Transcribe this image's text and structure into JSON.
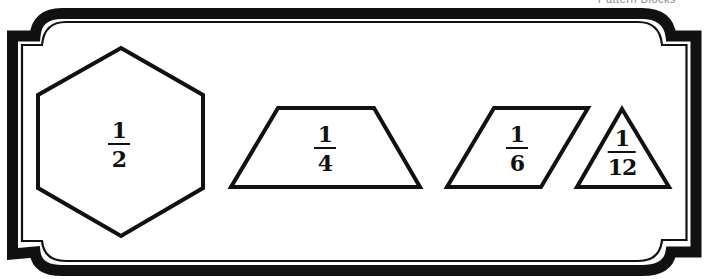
{
  "header": {
    "cropped_caption": "Pattern Blocks"
  },
  "colors": {
    "ink": "#111111",
    "background": "#ffffff"
  },
  "shapes": [
    {
      "name": "hexagon",
      "numerator": "1",
      "denominator": "2"
    },
    {
      "name": "trapezoid",
      "numerator": "1",
      "denominator": "4"
    },
    {
      "name": "rhombus",
      "numerator": "1",
      "denominator": "6"
    },
    {
      "name": "triangle",
      "numerator": "1",
      "denominator": "12"
    }
  ]
}
